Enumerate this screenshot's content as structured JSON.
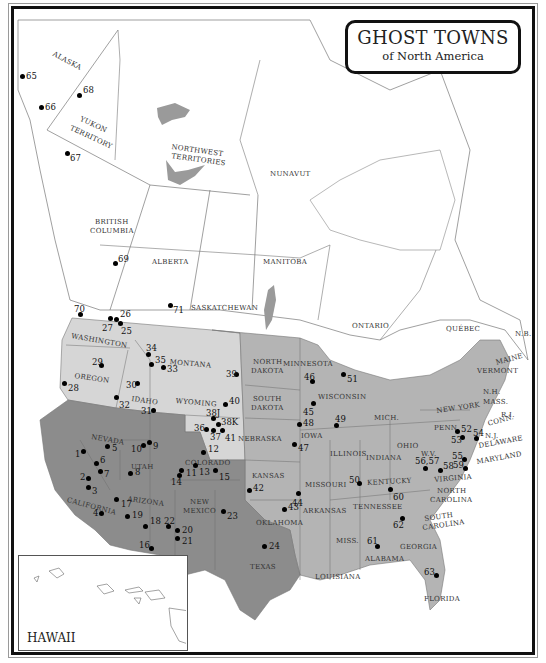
{
  "title": {
    "main": "GHOST TOWNS",
    "sub": "of North America"
  },
  "colors": {
    "dark_region": "#8c8c8c",
    "medium_region": "#b4b4b4",
    "light_region": "#d6d6d6",
    "canada": "#ffffff",
    "water": "#9a9a9a",
    "border": "#111111"
  },
  "regions": {
    "canada": [
      "ALASKA",
      "YUKON TERRITORY",
      "NORTHWEST TERRITORIES",
      "NUNAVUT",
      "BRITISH COLUMBIA",
      "ALBERTA",
      "SASKATCHEWAN",
      "MANITOBA",
      "ONTARIO",
      "QUÉBEC",
      "N.B."
    ],
    "usa": [
      "WASHINGTON",
      "OREGON",
      "IDAHO",
      "MONTANA",
      "WYOMING",
      "NORTH DAKOTA",
      "SOUTH DAKOTA",
      "NEBRASKA",
      "MINNESOTA",
      "WISCONSIN",
      "IOWA",
      "MICH.",
      "ILLINOIS",
      "INDIANA",
      "OHIO",
      "NEW YORK",
      "PENN.",
      "MAINE",
      "VERMONT",
      "N.H.",
      "MASS.",
      "R.I.",
      "CONN.",
      "N.J.",
      "DELAWARE",
      "MARYLAND",
      "W.V.",
      "VIRGINIA",
      "KENTUCKY",
      "NORTH CAROLINA",
      "TENNESSEE",
      "SOUTH CAROLINA",
      "GEORGIA",
      "ALABAMA",
      "MISS.",
      "FLORIDA",
      "LOUISIANA",
      "ARKANSAS",
      "MISSOURI",
      "KANSAS",
      "OKLAHOMA",
      "TEXAS",
      "NEW MEXICO",
      "COLORADO",
      "UTAH",
      "ARIZONA",
      "NEVADA",
      "CALIFORNIA"
    ],
    "inset": "HAWAII"
  },
  "labels": [
    {
      "text": "ALASKA",
      "x": 55,
      "y": 50,
      "rot": 28
    },
    {
      "text": "YUKON",
      "x": 82,
      "y": 115,
      "rot": 25
    },
    {
      "text": "TERRITORY",
      "x": 72,
      "y": 124,
      "rot": 25
    },
    {
      "text": "NORTHWEST",
      "x": 172,
      "y": 143,
      "rot": 8
    },
    {
      "text": "TERRITORIES",
      "x": 172,
      "y": 152,
      "rot": 8
    },
    {
      "text": "NUNAVUT",
      "x": 270,
      "y": 170,
      "rot": 0
    },
    {
      "text": "BRITISH",
      "x": 95,
      "y": 218,
      "rot": 0
    },
    {
      "text": "COLUMBIA",
      "x": 90,
      "y": 227,
      "rot": 0
    },
    {
      "text": "ALBERTA",
      "x": 152,
      "y": 258,
      "rot": 0
    },
    {
      "text": "MANITOBA",
      "x": 263,
      "y": 258,
      "rot": 0
    },
    {
      "text": "SASKATCHEWAN",
      "x": 191,
      "y": 304,
      "rot": 0
    },
    {
      "text": "ONTARIO",
      "x": 352,
      "y": 322,
      "rot": 0
    },
    {
      "text": "QUÉBEC",
      "x": 446,
      "y": 325,
      "rot": 0
    },
    {
      "text": "N.B.",
      "x": 515,
      "y": 330,
      "rot": 0
    },
    {
      "text": "WASHINGTON",
      "x": 72,
      "y": 332,
      "rot": 10
    },
    {
      "text": "OREGON",
      "x": 75,
      "y": 372,
      "rot": 8
    },
    {
      "text": "IDAHO",
      "x": 132,
      "y": 395,
      "rot": 8
    },
    {
      "text": "MONTANA",
      "x": 170,
      "y": 358,
      "rot": 5
    },
    {
      "text": "WYOMING",
      "x": 176,
      "y": 397,
      "rot": 5
    },
    {
      "text": "NORTH",
      "x": 253,
      "y": 358,
      "rot": 0
    },
    {
      "text": "DAKOTA",
      "x": 251,
      "y": 367,
      "rot": 0
    },
    {
      "text": "SOUTH",
      "x": 253,
      "y": 395,
      "rot": 0
    },
    {
      "text": "DAKOTA",
      "x": 251,
      "y": 404,
      "rot": 0
    },
    {
      "text": "NEBRASKA",
      "x": 238,
      "y": 435,
      "rot": 0
    },
    {
      "text": "MINNESOTA",
      "x": 283,
      "y": 360,
      "rot": 0
    },
    {
      "text": "WISCONSIN",
      "x": 318,
      "y": 393,
      "rot": 0
    },
    {
      "text": "IOWA",
      "x": 301,
      "y": 432,
      "rot": 0
    },
    {
      "text": "MICH.",
      "x": 374,
      "y": 414,
      "rot": 0
    },
    {
      "text": "ILLINOIS",
      "x": 330,
      "y": 450,
      "rot": 0
    },
    {
      "text": "INDIANA",
      "x": 366,
      "y": 454,
      "rot": 0
    },
    {
      "text": "OHIO",
      "x": 397,
      "y": 442,
      "rot": 0
    },
    {
      "text": "NEW YORK",
      "x": 436,
      "y": 407,
      "rot": -8
    },
    {
      "text": "PENN.",
      "x": 434,
      "y": 424,
      "rot": 0
    },
    {
      "text": "MAINE",
      "x": 495,
      "y": 359,
      "rot": -15
    },
    {
      "text": "VERMONT",
      "x": 477,
      "y": 367,
      "rot": 0
    },
    {
      "text": "N.H.",
      "x": 483,
      "y": 388,
      "rot": 0
    },
    {
      "text": "MASS.",
      "x": 483,
      "y": 398,
      "rot": 0
    },
    {
      "text": "R.I.",
      "x": 501,
      "y": 411,
      "rot": 0
    },
    {
      "text": "CONN.",
      "x": 487,
      "y": 420,
      "rot": -15
    },
    {
      "text": "N.J.",
      "x": 485,
      "y": 432,
      "rot": 0
    },
    {
      "text": "DELAWARE",
      "x": 478,
      "y": 442,
      "rot": -10
    },
    {
      "text": "MARYLAND",
      "x": 476,
      "y": 458,
      "rot": -10
    },
    {
      "text": "W.V.",
      "x": 421,
      "y": 450,
      "rot": 0
    },
    {
      "text": "VIRGINIA",
      "x": 434,
      "y": 476,
      "rot": -5
    },
    {
      "text": "KENTUCKY",
      "x": 367,
      "y": 479,
      "rot": -3
    },
    {
      "text": "NORTH",
      "x": 437,
      "y": 487,
      "rot": 0
    },
    {
      "text": "CAROLINA",
      "x": 430,
      "y": 496,
      "rot": 0
    },
    {
      "text": "TENNESSEE",
      "x": 353,
      "y": 503,
      "rot": 0
    },
    {
      "text": "SOUTH",
      "x": 424,
      "y": 515,
      "rot": -8
    },
    {
      "text": "CAROLINA",
      "x": 422,
      "y": 524,
      "rot": -8
    },
    {
      "text": "GEORGIA",
      "x": 400,
      "y": 543,
      "rot": 0
    },
    {
      "text": "ALABAMA",
      "x": 365,
      "y": 555,
      "rot": 0
    },
    {
      "text": "MISS.",
      "x": 336,
      "y": 537,
      "rot": 0
    },
    {
      "text": "FLORIDA",
      "x": 424,
      "y": 595,
      "rot": 0
    },
    {
      "text": "LOUISIANA",
      "x": 315,
      "y": 573,
      "rot": 0
    },
    {
      "text": "ARKANSAS",
      "x": 303,
      "y": 507,
      "rot": 0
    },
    {
      "text": "MISSOURI",
      "x": 305,
      "y": 481,
      "rot": 0
    },
    {
      "text": "KANSAS",
      "x": 252,
      "y": 472,
      "rot": 0
    },
    {
      "text": "OKLAHOMA",
      "x": 256,
      "y": 519,
      "rot": 0
    },
    {
      "text": "TEXAS",
      "x": 250,
      "y": 563,
      "rot": 0
    },
    {
      "text": "NEW",
      "x": 190,
      "y": 498,
      "rot": 0
    },
    {
      "text": "MEXICO",
      "x": 183,
      "y": 507,
      "rot": 0
    },
    {
      "text": "COLORADO",
      "x": 185,
      "y": 459,
      "rot": 0
    },
    {
      "text": "UTAH",
      "x": 131,
      "y": 463,
      "rot": 0
    },
    {
      "text": "ARIZONA",
      "x": 128,
      "y": 495,
      "rot": 8
    },
    {
      "text": "NEVADA",
      "x": 92,
      "y": 433,
      "rot": 10
    },
    {
      "text": "CALIFORNIA",
      "x": 68,
      "y": 496,
      "rot": 15
    }
  ],
  "ghost_towns": [
    {
      "n": "1",
      "x": 83,
      "y": 451,
      "lx": -8,
      "ly": -2
    },
    {
      "n": "2",
      "x": 88,
      "y": 478,
      "lx": -8,
      "ly": -6
    },
    {
      "n": "3",
      "x": 88,
      "y": 487,
      "lx": 4,
      "ly": -1
    },
    {
      "n": "4",
      "x": 101,
      "y": 513,
      "lx": -8,
      "ly": -5
    },
    {
      "n": "5",
      "x": 107,
      "y": 446,
      "lx": 5,
      "ly": -3
    },
    {
      "n": "6",
      "x": 96,
      "y": 463,
      "lx": 4,
      "ly": -8
    },
    {
      "n": "7",
      "x": 100,
      "y": 471,
      "lx": 4,
      "ly": -2
    },
    {
      "n": "8",
      "x": 130,
      "y": 473,
      "lx": 5,
      "ly": -6
    },
    {
      "n": "9",
      "x": 149,
      "y": 442,
      "lx": 4,
      "ly": -1
    },
    {
      "n": "10",
      "x": 143,
      "y": 445,
      "lx": -12,
      "ly": -1
    },
    {
      "n": "11",
      "x": 181,
      "y": 470,
      "lx": 5,
      "ly": -2
    },
    {
      "n": "12",
      "x": 203,
      "y": 452,
      "lx": 5,
      "ly": -8
    },
    {
      "n": "13",
      "x": 195,
      "y": 465,
      "lx": 4,
      "ly": 2
    },
    {
      "n": "14",
      "x": 179,
      "y": 475,
      "lx": -8,
      "ly": 2
    },
    {
      "n": "15",
      "x": 215,
      "y": 470,
      "lx": 4,
      "ly": 2
    },
    {
      "n": "16",
      "x": 151,
      "y": 548,
      "lx": -12,
      "ly": -8
    },
    {
      "n": "17",
      "x": 116,
      "y": 499,
      "lx": 5,
      "ly": 0
    },
    {
      "n": "18",
      "x": 145,
      "y": 526,
      "lx": 5,
      "ly": -10
    },
    {
      "n": "19",
      "x": 127,
      "y": 516,
      "lx": 5,
      "ly": -6
    },
    {
      "n": "20",
      "x": 177,
      "y": 530,
      "lx": 5,
      "ly": -5
    },
    {
      "n": "21",
      "x": 177,
      "y": 538,
      "lx": 5,
      "ly": -2
    },
    {
      "n": "22",
      "x": 168,
      "y": 526,
      "lx": -4,
      "ly": -10
    },
    {
      "n": "23",
      "x": 223,
      "y": 511,
      "lx": 4,
      "ly": 0
    },
    {
      "n": "24",
      "x": 264,
      "y": 546,
      "lx": 5,
      "ly": -5
    },
    {
      "n": "25",
      "x": 120,
      "y": 323,
      "lx": 1,
      "ly": 3
    },
    {
      "n": "26",
      "x": 116,
      "y": 319,
      "lx": 4,
      "ly": -10
    },
    {
      "n": "27",
      "x": 110,
      "y": 318,
      "lx": -8,
      "ly": 5
    },
    {
      "n": "28",
      "x": 64,
      "y": 383,
      "lx": 4,
      "ly": 0
    },
    {
      "n": "29",
      "x": 101,
      "y": 365,
      "lx": -9,
      "ly": -8
    },
    {
      "n": "30",
      "x": 137,
      "y": 383,
      "lx": -11,
      "ly": -3
    },
    {
      "n": "31",
      "x": 153,
      "y": 410,
      "lx": -12,
      "ly": -4
    },
    {
      "n": "32",
      "x": 116,
      "y": 397,
      "lx": 3,
      "ly": 3
    },
    {
      "n": "33",
      "x": 163,
      "y": 367,
      "lx": 4,
      "ly": -3
    },
    {
      "n": "34",
      "x": 148,
      "y": 354,
      "lx": -2,
      "ly": -11
    },
    {
      "n": "35",
      "x": 151,
      "y": 364,
      "lx": 4,
      "ly": -9
    },
    {
      "n": "36",
      "x": 206,
      "y": 429,
      "lx": -12,
      "ly": -6
    },
    {
      "n": "37",
      "x": 213,
      "y": 430,
      "lx": -3,
      "ly": 2
    },
    {
      "n": "38J",
      "x": 213,
      "y": 418,
      "lx": -7,
      "ly": -10
    },
    {
      "n": "38K",
      "x": 218,
      "y": 424,
      "lx": 3,
      "ly": -7
    },
    {
      "n": "39",
      "x": 236,
      "y": 374,
      "lx": -10,
      "ly": -5
    },
    {
      "n": "40",
      "x": 225,
      "y": 404,
      "lx": 4,
      "ly": -8
    },
    {
      "n": "41",
      "x": 222,
      "y": 430,
      "lx": 3,
      "ly": 3
    },
    {
      "n": "42",
      "x": 249,
      "y": 490,
      "lx": 4,
      "ly": -7
    },
    {
      "n": "43",
      "x": 284,
      "y": 509,
      "lx": 4,
      "ly": -7
    },
    {
      "n": "44",
      "x": 298,
      "y": 493,
      "lx": -6,
      "ly": 5
    },
    {
      "n": "45",
      "x": 313,
      "y": 403,
      "lx": -10,
      "ly": 4
    },
    {
      "n": "46",
      "x": 312,
      "y": 381,
      "lx": -8,
      "ly": -9
    },
    {
      "n": "47",
      "x": 294,
      "y": 444,
      "lx": 4,
      "ly": -1
    },
    {
      "n": "48",
      "x": 299,
      "y": 424,
      "lx": 4,
      "ly": -6
    },
    {
      "n": "49",
      "x": 336,
      "y": 425,
      "lx": -1,
      "ly": -11
    },
    {
      "n": "50",
      "x": 359,
      "y": 483,
      "lx": -10,
      "ly": -8
    },
    {
      "n": "51",
      "x": 343,
      "y": 374,
      "lx": 4,
      "ly": 0
    },
    {
      "n": "52",
      "x": 457,
      "y": 431,
      "lx": 4,
      "ly": -7
    },
    {
      "n": "53",
      "x": 462,
      "y": 437,
      "lx": -11,
      "ly": -2
    },
    {
      "n": "54",
      "x": 476,
      "y": 438,
      "lx": -3,
      "ly": -10
    },
    {
      "n": "55",
      "x": 464,
      "y": 459,
      "lx": -12,
      "ly": -8
    },
    {
      "n": "56,57",
      "x": 425,
      "y": 468,
      "lx": -10,
      "ly": -12
    },
    {
      "n": "58",
      "x": 440,
      "y": 470,
      "lx": 3,
      "ly": -9
    },
    {
      "n": "59",
      "x": 465,
      "y": 468,
      "lx": -12,
      "ly": -8
    },
    {
      "n": "60",
      "x": 390,
      "y": 489,
      "lx": 3,
      "ly": 3
    },
    {
      "n": "61",
      "x": 377,
      "y": 546,
      "lx": -10,
      "ly": -10
    },
    {
      "n": "62",
      "x": 402,
      "y": 518,
      "lx": -9,
      "ly": 2
    },
    {
      "n": "63",
      "x": 436,
      "y": 575,
      "lx": -12,
      "ly": -8
    },
    {
      "n": "64",
      "x": 120,
      "y": 585,
      "lx": 3,
      "ly": -9
    },
    {
      "n": "65",
      "x": 22,
      "y": 76,
      "lx": 4,
      "ly": -5
    },
    {
      "n": "66",
      "x": 41,
      "y": 107,
      "lx": 4,
      "ly": -5
    },
    {
      "n": "67",
      "x": 67,
      "y": 153,
      "lx": 3,
      "ly": 0
    },
    {
      "n": "68",
      "x": 79,
      "y": 95,
      "lx": 4,
      "ly": -10
    },
    {
      "n": "69",
      "x": 115,
      "y": 263,
      "lx": 3,
      "ly": -9
    },
    {
      "n": "70",
      "x": 80,
      "y": 314,
      "lx": -6,
      "ly": -10
    },
    {
      "n": "71",
      "x": 170,
      "y": 305,
      "lx": 3,
      "ly": 0
    }
  ]
}
